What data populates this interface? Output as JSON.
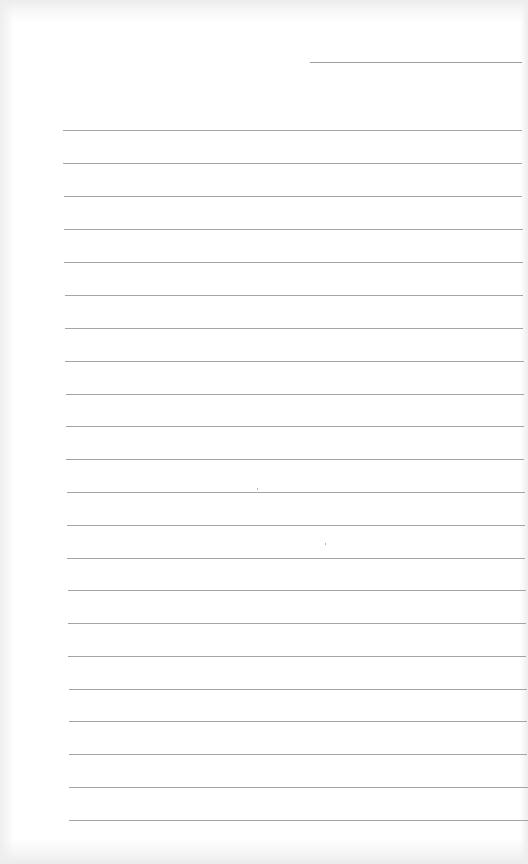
{
  "document": {
    "type": "lined-paper",
    "background_color": "#ffffff",
    "rule_color": "#a4a4a4",
    "header_rule": {
      "y": 62,
      "x1": 310,
      "x2": 522
    },
    "rule_spacing_px": 33,
    "rules": [
      {
        "y": 130,
        "x1": 63,
        "x2": 522
      },
      {
        "y": 163,
        "x1": 63,
        "x2": 522
      },
      {
        "y": 196,
        "x1": 64,
        "x2": 522
      },
      {
        "y": 229,
        "x1": 64,
        "x2": 523
      },
      {
        "y": 262,
        "x1": 64,
        "x2": 523
      },
      {
        "y": 295,
        "x1": 65,
        "x2": 523
      },
      {
        "y": 328,
        "x1": 65,
        "x2": 523
      },
      {
        "y": 361,
        "x1": 65,
        "x2": 524
      },
      {
        "y": 394,
        "x1": 66,
        "x2": 524
      },
      {
        "y": 426,
        "x1": 66,
        "x2": 524
      },
      {
        "y": 459,
        "x1": 66,
        "x2": 524
      },
      {
        "y": 492,
        "x1": 67,
        "x2": 525
      },
      {
        "y": 525,
        "x1": 67,
        "x2": 525
      },
      {
        "y": 558,
        "x1": 67,
        "x2": 525
      },
      {
        "y": 590,
        "x1": 68,
        "x2": 526
      },
      {
        "y": 623,
        "x1": 68,
        "x2": 526
      },
      {
        "y": 656,
        "x1": 68,
        "x2": 526
      },
      {
        "y": 689,
        "x1": 69,
        "x2": 527
      },
      {
        "y": 721,
        "x1": 69,
        "x2": 527
      },
      {
        "y": 754,
        "x1": 69,
        "x2": 527
      },
      {
        "y": 787,
        "x1": 69,
        "x2": 528
      },
      {
        "y": 820,
        "x1": 69,
        "x2": 528
      }
    ],
    "rule_count": 22,
    "written_text": []
  }
}
